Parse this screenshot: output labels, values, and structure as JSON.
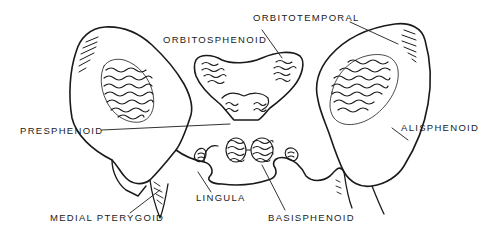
{
  "diagram": {
    "labels": {
      "orbitotemporal": "ORBITOTEMPORAL",
      "orbitosphenoid": "ORBITOSPHENOID",
      "presphenoid": "PRESPHENOID",
      "alisphenoid": "ALISPHENOID",
      "lingula": "LINGULA",
      "medial_pterygoid": "MEDIAL PTERYGOID",
      "basisphenoid": "BASISPHENOID"
    },
    "colors": {
      "ink": "#1a1a1a",
      "background": "#ffffff"
    }
  }
}
